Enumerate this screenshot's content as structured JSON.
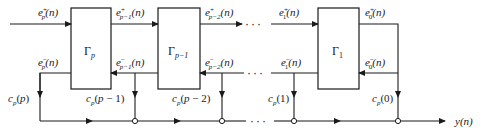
{
  "diagram": {
    "blocks": [
      {
        "id": "gamma-p",
        "label": "Γp"
      },
      {
        "id": "gamma-p-1",
        "label": "Γp−1"
      },
      {
        "id": "gamma-1",
        "label": "Γ1"
      }
    ],
    "signals": {
      "input_forward": "e⁺p(n)",
      "input_backward": "e⁻p(n)",
      "forward_p1": "e⁺p−1(n)",
      "backward_p1": "e⁻p−1(n)",
      "forward_p2": "e⁺p−2(n)",
      "backward_p2": "e⁻p−2(n)",
      "forward_1": "e⁺1(n)",
      "backward_1": "e⁻1(n)",
      "forward_0": "e⁺0(n)",
      "backward_0": "e⁻0(n)"
    },
    "coefficients": {
      "c_p": "cp(p)",
      "c_p1": "cp(p − 1)",
      "c_p2": "cp(p − 2)",
      "c_1": "cp(1)",
      "c_0": "cp(0)"
    },
    "output": "y(n)",
    "ellipsis": "···"
  }
}
